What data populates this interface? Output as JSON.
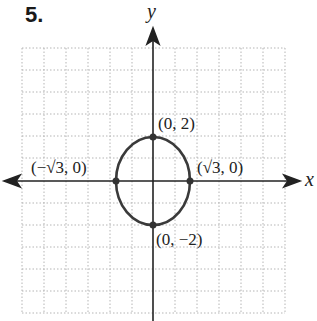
{
  "problem_number": "5.",
  "axes": {
    "x_label": "x",
    "y_label": "y"
  },
  "curve": {
    "type": "ellipse",
    "equation": "x^2/3 + y^2/4 = 1",
    "center": [
      0,
      0
    ],
    "semi_x": 1.732,
    "semi_y": 2
  },
  "points": [
    {
      "id": "top",
      "label": "(0, 2)",
      "x": 0,
      "y": 2
    },
    {
      "id": "right",
      "label": "(√3, 0)",
      "x": 1.732,
      "y": 0
    },
    {
      "id": "left",
      "label": "(−√3, 0)",
      "x": -1.732,
      "y": 0
    },
    {
      "id": "bottom",
      "label": "(0, −2)",
      "x": 0,
      "y": -2
    }
  ],
  "grid": {
    "x_range": [
      -6,
      6
    ],
    "y_range": [
      -6,
      6
    ],
    "step": 1
  },
  "colors": {
    "curve": "#3a3a3a",
    "grid": "#b0b0b0",
    "axis": "#222222"
  }
}
